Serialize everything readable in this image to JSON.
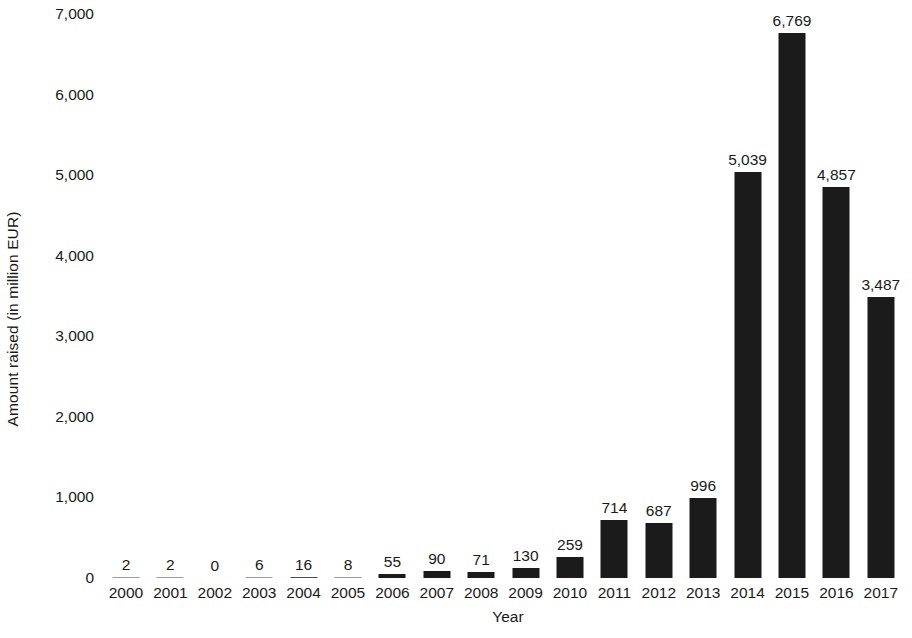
{
  "chart_data": {
    "type": "bar",
    "title": "",
    "xlabel": "Year",
    "ylabel": "Amount raised (in million EUR)",
    "categories": [
      "2000",
      "2001",
      "2002",
      "2003",
      "2004",
      "2005",
      "2006",
      "2007",
      "2008",
      "2009",
      "2010",
      "2011",
      "2012",
      "2013",
      "2014",
      "2015",
      "2016",
      "2017"
    ],
    "values": [
      2,
      2,
      0,
      6,
      16,
      8,
      55,
      90,
      71,
      130,
      259,
      714,
      687,
      996,
      5039,
      6769,
      4857,
      3487
    ],
    "value_labels": [
      "2",
      "2",
      "0",
      "6",
      "16",
      "8",
      "55",
      "90",
      "71",
      "130",
      "259",
      "714",
      "687",
      "996",
      "5,039",
      "6,769",
      "4,857",
      "3,487"
    ],
    "ylim": [
      0,
      7000
    ],
    "ytick_values": [
      0,
      1000,
      2000,
      3000,
      4000,
      5000,
      6000,
      7000
    ],
    "ytick_labels": [
      "0",
      "1,000",
      "2,000",
      "3,000",
      "4,000",
      "5,000",
      "6,000",
      "7,000"
    ],
    "grid": false,
    "legend": false,
    "bar_color": "#1b1b1b",
    "background_color": "#ffffff",
    "text_color": "#1a1a1a"
  }
}
